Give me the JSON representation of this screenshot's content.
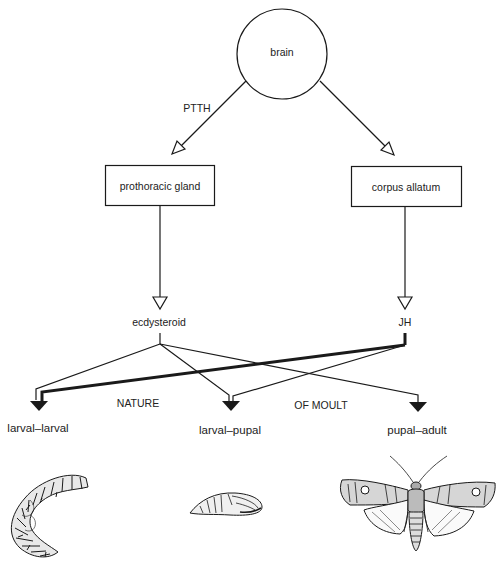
{
  "diagram": {
    "nodes": {
      "brain": {
        "label": "brain"
      },
      "prothoracic_gland": {
        "label": "prothoracic gland"
      },
      "corpus_allatum": {
        "label": "corpus allatum"
      },
      "ecdysteroid": {
        "label": "ecdysteroid"
      },
      "jh": {
        "label": "JH"
      }
    },
    "edge_labels": {
      "ptth": "PTTH"
    },
    "outcomes": [
      {
        "label": "larval–larval",
        "illustration": "caterpillar-larva"
      },
      {
        "label": "larval–pupal",
        "illustration": "pupa"
      },
      {
        "label": "pupal–adult",
        "illustration": "adult-moth"
      }
    ],
    "caption": {
      "left": "NATURE",
      "right": "OF MOULT"
    },
    "edges": [
      {
        "from": "brain",
        "to": "prothoracic_gland",
        "label": "PTTH",
        "style": "open-arrow"
      },
      {
        "from": "brain",
        "to": "corpus_allatum",
        "style": "open-arrow"
      },
      {
        "from": "prothoracic_gland",
        "to": "ecdysteroid",
        "style": "open-arrow"
      },
      {
        "from": "corpus_allatum",
        "to": "jh",
        "style": "open-arrow"
      },
      {
        "from": "ecdysteroid",
        "to": "larval–larval",
        "style": "thin"
      },
      {
        "from": "ecdysteroid",
        "to": "larval–pupal",
        "style": "thin"
      },
      {
        "from": "ecdysteroid",
        "to": "pupal–adult",
        "style": "thin"
      },
      {
        "from": "jh",
        "to": "larval–larval",
        "style": "thick"
      },
      {
        "from": "jh",
        "to": "larval–pupal",
        "style": "thin"
      }
    ]
  },
  "colors": {
    "ink": "#1a1a1a",
    "background": "#ffffff"
  }
}
